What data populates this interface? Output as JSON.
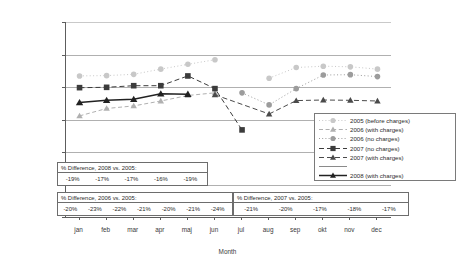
{
  "chart_data": {
    "type": "line",
    "title": "",
    "xlabel": "Month",
    "ylabel": "Trips per Day during Charged Hours",
    "categories": [
      "jan",
      "feb",
      "mar",
      "apr",
      "maj",
      "jun",
      "jul",
      "aug",
      "sep",
      "okt",
      "nov",
      "dec"
    ],
    "ylim": [
      0,
      600000
    ],
    "yticks": [
      "0",
      "100 000",
      "200 000",
      "300 000",
      "400 000",
      "500 000",
      "600 000"
    ],
    "ytick_values": [
      0,
      100000,
      200000,
      300000,
      400000,
      500000,
      600000
    ],
    "grid": true,
    "legend_position": "right-inside",
    "series": [
      {
        "name": "2005 (before charges)",
        "style": "dotted-light",
        "marker": "circle",
        "color": "#c8c8c8",
        "values": [
          434000,
          435000,
          439000,
          455000,
          470000,
          484000,
          null,
          427000,
          460000,
          464000,
          462000,
          455000
        ]
      },
      {
        "name": "2006 (with charges)",
        "style": "dashed-light",
        "marker": "triangle",
        "color": "#b0b0b0",
        "values": [
          311000,
          334000,
          342000,
          357000,
          374000,
          382000,
          null,
          null,
          null,
          null,
          null,
          null
        ]
      },
      {
        "name": "2006 (no charges)",
        "style": "dotted-light",
        "marker": "circle",
        "color": "#9c9c9c",
        "values": [
          null,
          null,
          null,
          null,
          null,
          null,
          382000,
          345000,
          395000,
          437000,
          438000,
          432000
        ]
      },
      {
        "name": "2007 (no charges)",
        "style": "dashed-dark",
        "marker": "square",
        "color": "#3c3c3c",
        "values": [
          398000,
          399000,
          404000,
          404000,
          434000,
          395000,
          268000,
          null,
          null,
          null,
          null,
          null
        ]
      },
      {
        "name": "2007 (with charges)",
        "style": "dashed-dark",
        "marker": "triangle",
        "color": "#4a4a4a",
        "values": [
          null,
          null,
          null,
          null,
          null,
          376000,
          null,
          317000,
          358000,
          360000,
          359000,
          357000
        ]
      },
      {
        "name": "2008 (with charges)",
        "style": "solid-dark",
        "marker": "triangle",
        "color": "#222222",
        "values": [
          352000,
          359000,
          362000,
          379000,
          378000,
          null,
          null,
          null,
          null,
          null,
          null,
          null
        ]
      }
    ]
  },
  "legend": {
    "items": [
      {
        "label": "2005 (before charges)",
        "key": "dotted-circle-light"
      },
      {
        "label": "2006 (with charges)",
        "key": "dashed-triangle-light"
      },
      {
        "label": "2006 (no charges)",
        "key": "dotted-circle-mid"
      },
      {
        "label": "2007 (no charges)",
        "key": "dashed-square-dark"
      },
      {
        "label": "2007 (with charges)",
        "key": "dashed-triangle-dark"
      },
      {
        "label": "",
        "key": "plain-rule"
      },
      {
        "label": "2008 (with charges)",
        "key": "solid-triangle-dark"
      }
    ]
  },
  "difference_tables": [
    {
      "id": "diff2008",
      "title": "% Difference, 2008 vs. 2005:",
      "values": [
        "-19%",
        "-17%",
        "-17%",
        "-16%",
        "-19%"
      ]
    },
    {
      "id": "diff2006",
      "title": "% Difference, 2006 vs. 2005:",
      "values": [
        "-20%",
        "-23%",
        "-22%",
        "-21%",
        "-20%",
        "-21%",
        "-24%"
      ]
    },
    {
      "id": "diff2007",
      "title": "% Difference, 2007 vs. 2005:",
      "values": [
        "-21%",
        "-20%",
        "-17%",
        "-18%",
        "-17%"
      ]
    }
  ]
}
